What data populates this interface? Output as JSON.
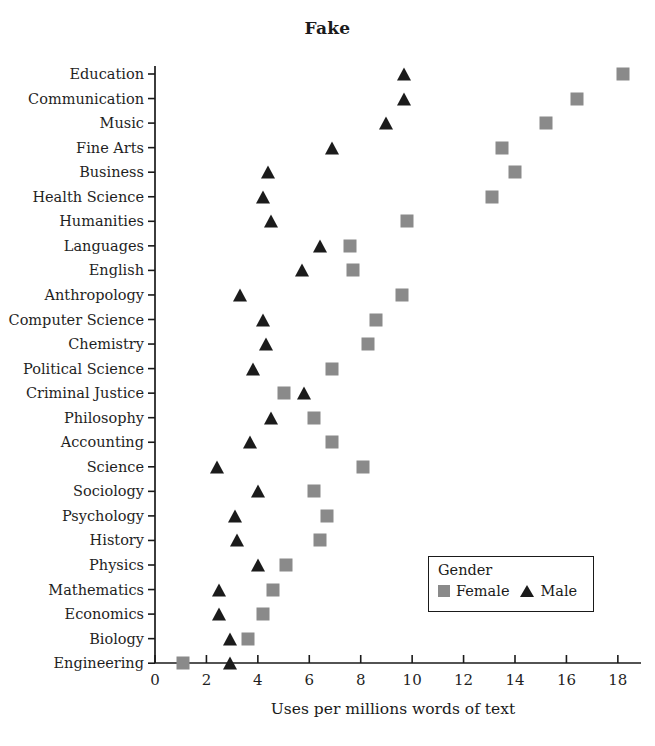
{
  "chart_data": {
    "type": "scatter",
    "title": "Fake",
    "xlabel": "Uses per millions words of text",
    "ylabel": "",
    "xlim": [
      0,
      18.9
    ],
    "xticks": [
      0,
      2,
      4,
      6,
      8,
      10,
      12,
      14,
      16,
      18
    ],
    "xticklabels": [
      "0",
      "2",
      "4",
      "6",
      "8",
      "10",
      "12",
      "14",
      "16",
      "18"
    ],
    "grid": false,
    "legend": {
      "title": "Gender",
      "position": "lower-right-inside",
      "entries": [
        {
          "name": "Female",
          "marker": "square",
          "color": "#8a8a8a"
        },
        {
          "name": "Male",
          "marker": "triangle",
          "color": "#1b1b1b"
        }
      ]
    },
    "categories": [
      "Education",
      "Communication",
      "Music",
      "Fine Arts",
      "Business",
      "Health Science",
      "Humanities",
      "Languages",
      "English",
      "Anthropology",
      "Computer Science",
      "Chemistry",
      "Political Science",
      "Criminal Justice",
      "Philosophy",
      "Accounting",
      "Science",
      "Sociology",
      "Psychology",
      "History",
      "Physics",
      "Mathematics",
      "Economics",
      "Biology",
      "Engineering"
    ],
    "series": [
      {
        "name": "Female",
        "marker": "square",
        "color": "#8a8a8a",
        "values": [
          18.2,
          16.4,
          15.2,
          13.5,
          14.0,
          13.1,
          9.8,
          7.6,
          7.7,
          9.6,
          8.6,
          8.3,
          6.9,
          5.0,
          6.2,
          6.9,
          8.1,
          6.2,
          6.7,
          6.4,
          5.1,
          4.6,
          4.2,
          3.6,
          1.1
        ]
      },
      {
        "name": "Male",
        "marker": "triangle",
        "color": "#1b1b1b",
        "values": [
          9.7,
          9.7,
          9.0,
          6.9,
          4.4,
          4.2,
          4.5,
          6.4,
          5.7,
          3.3,
          4.2,
          4.3,
          3.8,
          5.8,
          4.5,
          3.7,
          2.4,
          4.0,
          3.1,
          3.2,
          4.0,
          2.5,
          2.5,
          2.9,
          2.9
        ]
      }
    ]
  }
}
